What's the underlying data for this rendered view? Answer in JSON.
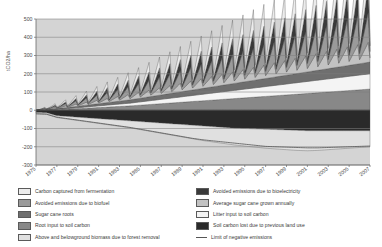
{
  "axes": {
    "ylabel": "tCO2/ha",
    "ylim": [
      -300,
      500
    ],
    "yticks": [
      -300,
      -200,
      -100,
      0,
      100,
      200,
      300,
      400,
      500
    ],
    "ytick_labels": [
      "-300",
      "-200",
      "-100",
      "0",
      "100",
      "200",
      "300",
      "400",
      "500"
    ],
    "xlim": [
      1975,
      2007
    ],
    "xticks": [
      1975,
      1977,
      1979,
      1981,
      1983,
      1985,
      1987,
      1989,
      1991,
      1993,
      1995,
      1997,
      1999,
      2001,
      2003,
      2005,
      2007
    ],
    "xtick_labels": [
      "1975",
      "1977",
      "1979",
      "1981",
      "1983",
      "1985",
      "1987",
      "1989",
      "1991",
      "1993",
      "1995",
      "1997",
      "1999",
      "2001",
      "2003",
      "2005",
      "2007"
    ],
    "grid": true,
    "plot_bg": "#d4d4d4"
  },
  "legend": {
    "position": "below-plot",
    "columns": [
      {
        "items": [
          {
            "label": "Carbon captured from fermentation",
            "color": "#ececec",
            "swatch": "box"
          },
          {
            "label": "Avoided emissions due to biofuel",
            "color": "#9a9a9a",
            "swatch": "box"
          },
          {
            "label": "Sugar cane roots",
            "color": "#6f6f6f",
            "swatch": "box"
          },
          {
            "label": "Root input to soil carbon",
            "color": "#888888",
            "swatch": "box"
          },
          {
            "label": "Above and belowground biomass due to forest removal",
            "color": "#e0e0e0",
            "swatch": "box"
          }
        ]
      },
      {
        "items": [
          {
            "label": "Avoided emissions due to bioelectricity",
            "color": "#3a3a3a",
            "swatch": "box"
          },
          {
            "label": "Average sugar cane grown annually",
            "color": "#c2c2c2",
            "swatch": "box"
          },
          {
            "label": "Litter input to soil carbon",
            "color": "#f4f4f4",
            "swatch": "box"
          },
          {
            "label": "Soil carbon lost due to previous land use",
            "color": "#2a2a2a",
            "swatch": "box"
          },
          {
            "label": "Limit of negative emissions",
            "color": "none",
            "swatch": "line"
          }
        ]
      }
    ]
  },
  "chart_data": {
    "type": "area",
    "title": "",
    "xlabel": "",
    "ylabel": "tCO2/ha",
    "xlim": [
      1975,
      2007
    ],
    "ylim": [
      -300,
      500
    ],
    "grid": true,
    "x": [
      1975,
      1976,
      1977,
      1978,
      1979,
      1980,
      1981,
      1982,
      1983,
      1984,
      1985,
      1986,
      1987,
      1988,
      1989,
      1990,
      1991,
      1992,
      1993,
      1994,
      1995,
      1996,
      1997,
      1998,
      1999,
      2000,
      2001,
      2002,
      2003,
      2004,
      2005,
      2006,
      2007
    ],
    "sawtooth_note": "Annual sugar cane crop accumulates then is harvested, producing a yearly sawtooth in the positive stack.",
    "series": [
      {
        "name": "Soil carbon lost due to previous land use",
        "color": "#2a2a2a",
        "stack": "negative",
        "values": [
          -12,
          -14,
          -30,
          -34,
          -38,
          -42,
          -46,
          -50,
          -54,
          -58,
          -62,
          -66,
          -70,
          -74,
          -78,
          -82,
          -86,
          -90,
          -94,
          -98,
          -100,
          -102,
          -104,
          -106,
          -108,
          -110,
          -112,
          -112,
          -112,
          -112,
          -112,
          -112,
          -112
        ]
      },
      {
        "name": "Above and belowground biomass due to forest removal",
        "color": "#e0e0e0",
        "stack": "negative",
        "values": [
          -5,
          -6,
          -10,
          -14,
          -18,
          -22,
          -26,
          -30,
          -34,
          -38,
          -44,
          -50,
          -56,
          -62,
          -68,
          -74,
          -80,
          -84,
          -88,
          -92,
          -96,
          -100,
          -104,
          -106,
          -108,
          -110,
          -110,
          -108,
          -104,
          -100,
          -96,
          -92,
          -88
        ]
      },
      {
        "name": "Root input to soil carbon",
        "color": "#888888",
        "stack": "positive",
        "values": [
          0,
          2,
          4,
          6,
          9,
          12,
          15,
          18,
          21,
          24,
          28,
          32,
          36,
          40,
          44,
          48,
          52,
          56,
          60,
          64,
          68,
          72,
          76,
          80,
          84,
          88,
          92,
          96,
          100,
          104,
          108,
          112,
          116
        ]
      },
      {
        "name": "Litter input to soil carbon",
        "color": "#f4f4f4",
        "stack": "positive",
        "values": [
          0,
          1,
          2,
          3,
          5,
          7,
          9,
          11,
          13,
          15,
          18,
          21,
          24,
          27,
          30,
          33,
          36,
          39,
          42,
          45,
          48,
          51,
          54,
          57,
          60,
          63,
          66,
          69,
          72,
          75,
          78,
          81,
          84
        ]
      },
      {
        "name": "Sugar cane roots",
        "color": "#6f6f6f",
        "stack": "positive",
        "values": [
          0,
          2,
          4,
          6,
          8,
          10,
          12,
          14,
          16,
          18,
          20,
          22,
          24,
          26,
          28,
          30,
          32,
          34,
          36,
          38,
          40,
          42,
          44,
          46,
          48,
          50,
          52,
          54,
          56,
          58,
          60,
          62,
          64
        ]
      },
      {
        "name": "Average sugar cane grown annually",
        "color": "#c2c2c2",
        "stack": "positive-sawtooth",
        "values": [
          0,
          4,
          8,
          12,
          16,
          20,
          24,
          28,
          32,
          36,
          40,
          44,
          48,
          52,
          56,
          60,
          64,
          68,
          72,
          76,
          80,
          84,
          88,
          92,
          96,
          100,
          104,
          108,
          112,
          116,
          120,
          124,
          128
        ]
      },
      {
        "name": "Avoided emissions due to biofuel",
        "color": "#9a9a9a",
        "stack": "positive-sawtooth",
        "values": [
          0,
          5,
          10,
          16,
          22,
          28,
          34,
          40,
          46,
          52,
          58,
          64,
          70,
          76,
          82,
          88,
          94,
          100,
          106,
          112,
          118,
          124,
          130,
          136,
          142,
          148,
          154,
          160,
          166,
          172,
          178,
          184,
          190
        ]
      },
      {
        "name": "Avoided emissions due to bioelectricity",
        "color": "#3a3a3a",
        "stack": "positive-sawtooth",
        "values": [
          0,
          3,
          7,
          11,
          15,
          20,
          25,
          30,
          35,
          40,
          46,
          52,
          58,
          64,
          70,
          76,
          82,
          88,
          94,
          100,
          106,
          112,
          118,
          124,
          130,
          136,
          142,
          148,
          154,
          160,
          166,
          172,
          178
        ]
      },
      {
        "name": "Carbon captured from fermentation",
        "color": "#ececec",
        "stack": "positive-sawtooth",
        "values": [
          0,
          4,
          9,
          14,
          19,
          25,
          31,
          37,
          43,
          49,
          56,
          63,
          70,
          77,
          84,
          91,
          98,
          105,
          112,
          119,
          126,
          133,
          140,
          147,
          154,
          161,
          168,
          175,
          182,
          189,
          196,
          203,
          210
        ]
      }
    ],
    "reference_line": {
      "name": "Limit of negative emissions",
      "color": "#555555",
      "values": [
        -20,
        -22,
        -38,
        -46,
        -54,
        -62,
        -70,
        -78,
        -86,
        -94,
        -104,
        -114,
        -124,
        -134,
        -144,
        -154,
        -162,
        -168,
        -174,
        -180,
        -186,
        -192,
        -198,
        -200,
        -202,
        -204,
        -206,
        -206,
        -204,
        -202,
        -200,
        -198,
        -196
      ]
    },
    "top_envelope": [
      0,
      10,
      22,
      34,
      48,
      62,
      78,
      94,
      110,
      126,
      144,
      162,
      180,
      198,
      216,
      234,
      252,
      268,
      284,
      300,
      316,
      332,
      348,
      362,
      376,
      390,
      404,
      416,
      428,
      440,
      452,
      464,
      476
    ]
  }
}
